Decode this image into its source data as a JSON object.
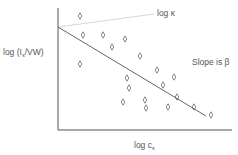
{
  "chart_data": {
    "type": "scatter",
    "title": "",
    "xlabel": "log c_s",
    "ylabel": "log (I_s/VW)",
    "xlabel_parts": {
      "main": "log c",
      "sub": "s"
    },
    "ylabel_parts": {
      "pre": "log (I",
      "sub": "s",
      "post": "/VW)"
    },
    "annotations": [
      {
        "text": "log κ",
        "points_to": "y-intercept of fitted line"
      },
      {
        "text": "Slope is β",
        "refers_to": "fitted line"
      }
    ],
    "axis_ticks": "none",
    "grid": false,
    "legend": "none",
    "marker": "◊",
    "points_px": [
      [
        80,
        16
      ],
      [
        83,
        35
      ],
      [
        103,
        35
      ],
      [
        125,
        39
      ],
      [
        80,
        64
      ],
      [
        112,
        47
      ],
      [
        140,
        56
      ],
      [
        157,
        70
      ],
      [
        163,
        85
      ],
      [
        127,
        78
      ],
      [
        129,
        88
      ],
      [
        174,
        77
      ],
      [
        145,
        100
      ],
      [
        177,
        97
      ],
      [
        146,
        108
      ],
      [
        123,
        102
      ],
      [
        168,
        107
      ],
      [
        194,
        107
      ],
      [
        211,
        115
      ]
    ],
    "fit_line_px": {
      "x1": 58,
      "y1": 27,
      "x2": 206,
      "y2": 116
    },
    "kappa_leader_px": {
      "x1": 58,
      "y1": 27,
      "x2": 154,
      "y2": 14
    },
    "axes_px": {
      "origin": [
        58,
        130
      ],
      "x_end": 232,
      "y_top": 8
    },
    "colors": {
      "axis": "#555555",
      "fit_line": "#666666",
      "leader": "#cccccc",
      "marker": "#555555",
      "text": "#555555"
    }
  },
  "labels": {
    "y": {
      "pre": "log (I",
      "sub": "s",
      "post": "/VW)"
    },
    "x": {
      "main": "log c",
      "sub": "s"
    },
    "slope": "Slope is β",
    "kappa": "log κ"
  }
}
